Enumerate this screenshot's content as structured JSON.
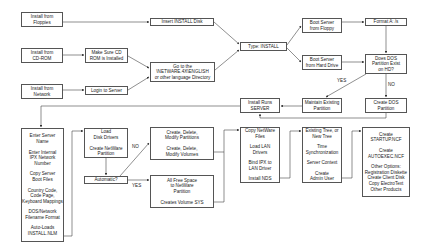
{
  "diagram": {
    "nodes": [
      {
        "id": "floppies",
        "lines": [
          "Install from",
          "Floppies"
        ],
        "x": 21,
        "y": 12,
        "w": 42,
        "h": 15
      },
      {
        "id": "cdrom",
        "lines": [
          "Install from",
          "CD-ROM"
        ],
        "x": 21,
        "y": 48,
        "w": 42,
        "h": 15
      },
      {
        "id": "network",
        "lines": [
          "Install from",
          "Network"
        ],
        "x": 21,
        "y": 84,
        "w": 42,
        "h": 15
      },
      {
        "id": "make-sure-cd",
        "lines": [
          "Make Sure CD",
          "ROM is Installed"
        ],
        "x": 85,
        "y": 48,
        "w": 43,
        "h": 15
      },
      {
        "id": "login",
        "lines": [
          "Login to Server"
        ],
        "x": 85,
        "y": 86,
        "w": 43,
        "h": 9
      },
      {
        "id": "insert-disk",
        "lines": [
          "Insert INSTALL Disk"
        ],
        "x": 150,
        "y": 18,
        "w": 64,
        "h": 8
      },
      {
        "id": "goto-netware",
        "lines": [
          "Go to the",
          "\\NETWARE.4X\\ENGLISH",
          "or other language Directory"
        ],
        "x": 150,
        "y": 62,
        "w": 65,
        "h": 20
      },
      {
        "id": "type-install",
        "lines": [
          "Type: INSTALL"
        ],
        "x": 240,
        "y": 42,
        "w": 47,
        "h": 9
      },
      {
        "id": "boot-floppy",
        "lines": [
          "Boot Server",
          "from Floppy"
        ],
        "x": 302,
        "y": 18,
        "w": 40,
        "h": 15
      },
      {
        "id": "boot-hd",
        "lines": [
          "Boot Server",
          "from Hard Drive"
        ],
        "x": 302,
        "y": 55,
        "w": 40,
        "h": 15
      },
      {
        "id": "format-a",
        "lines": [
          "Format A: /s"
        ],
        "x": 365,
        "y": 18,
        "w": 42,
        "h": 8
      },
      {
        "id": "dos-partition-exist",
        "lines": [
          "Does DOS",
          "Partition Exist",
          "on HD?"
        ],
        "x": 365,
        "y": 54,
        "w": 42,
        "h": 20
      },
      {
        "id": "maintain-partition",
        "lines": [
          "Maintain Existing",
          "Partition"
        ],
        "x": 302,
        "y": 98,
        "w": 40,
        "h": 15
      },
      {
        "id": "create-dos-partition",
        "lines": [
          "Create DOS",
          "Partition"
        ],
        "x": 365,
        "y": 98,
        "w": 42,
        "h": 15
      },
      {
        "id": "install-runs-server",
        "lines": [
          "Install Runs",
          "SERVER"
        ],
        "x": 240,
        "y": 98,
        "w": 40,
        "h": 15
      },
      {
        "id": "enter-server-info",
        "lines": [
          "Enter Server",
          "Name",
          "",
          "Enter Internal",
          "IPX Network",
          "Number",
          "",
          "Copy Server",
          "Boot Files",
          "",
          "Country Code,",
          "Code Page,",
          "Keyboard Mappings",
          "",
          "DOS/Network",
          "Filename Format",
          "",
          "Auto-Loads",
          "INSTALL.NLM"
        ],
        "x": 21,
        "y": 128,
        "w": 43,
        "h": 114
      },
      {
        "id": "load-disk-drivers",
        "lines": [
          "Load",
          "Disk Drivers",
          "",
          "Create NetWare",
          "Partition"
        ],
        "x": 84,
        "y": 128,
        "w": 44,
        "h": 30
      },
      {
        "id": "automatic",
        "lines": [
          "Automatic?"
        ],
        "x": 84,
        "y": 176,
        "w": 44,
        "h": 8
      },
      {
        "id": "create-modify",
        "lines": [
          "Create, Delete,",
          "Modify Partitions",
          "",
          "Create, Delete,",
          "Modify Volumes"
        ],
        "x": 150,
        "y": 127,
        "w": 64,
        "h": 33
      },
      {
        "id": "all-free-space",
        "lines": [
          "All Free Space",
          "to NetWare",
          "Partition",
          "",
          "Creates Volume SYS"
        ],
        "x": 150,
        "y": 175,
        "w": 64,
        "h": 33
      },
      {
        "id": "copy-netware",
        "lines": [
          "Copy NetWare",
          "Files",
          "",
          "Load LAN",
          "Drivers",
          "",
          "Bind IPX to",
          "LAN Driver",
          "",
          "Install NDS"
        ],
        "x": 240,
        "y": 127,
        "w": 40,
        "h": 56
      },
      {
        "id": "nds-tree",
        "lines": [
          "Existing Tree, or",
          "New Tree",
          "",
          "Time",
          "Synchronization",
          "",
          "Server Context",
          "",
          "Create",
          "Admin User"
        ],
        "x": 302,
        "y": 127,
        "w": 40,
        "h": 56
      },
      {
        "id": "create-startup",
        "lines": [
          "Create",
          "STARTUP.NCF",
          "",
          "Create",
          "AUTOEXEC.NCF",
          "",
          "Other Options:",
          "Registration Diskette",
          "Create Client Disk",
          "Copy ElectroText",
          "Other Products"
        ],
        "x": 362,
        "y": 127,
        "w": 48,
        "h": 70
      }
    ],
    "labels": [
      {
        "id": "yes-dos",
        "text": "YES",
        "x": 337,
        "y": 80
      },
      {
        "id": "no-dos",
        "text": "NO",
        "x": 388,
        "y": 84
      },
      {
        "id": "no-auto",
        "text": "NO",
        "x": 132,
        "y": 146
      },
      {
        "id": "yes-auto",
        "text": "YES",
        "x": 132,
        "y": 183
      }
    ],
    "colors": {
      "line": "#444444",
      "box_border": "#555555",
      "text": "#222222"
    }
  }
}
